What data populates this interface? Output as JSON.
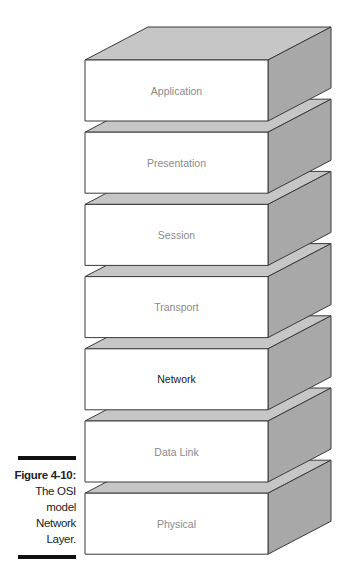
{
  "figure": {
    "label": "Figure 4-10:",
    "caption_lines": [
      "The OSI",
      "model",
      "Network",
      "Layer."
    ]
  },
  "layers": [
    {
      "name": "Application",
      "highlighted": false
    },
    {
      "name": "Presentation",
      "highlighted": false
    },
    {
      "name": "Session",
      "highlighted": false
    },
    {
      "name": "Transport",
      "highlighted": false
    },
    {
      "name": "Network",
      "highlighted": true
    },
    {
      "name": "Data Link",
      "highlighted": false
    },
    {
      "name": "Physical",
      "highlighted": false
    }
  ],
  "colors": {
    "front_face": "#ffffff",
    "top_face": "#c6c6c6",
    "side_face": "#a8a8a8",
    "edge": "#3a3a3a",
    "label": "#8a8a8a",
    "label_highlighted": "#1a1a1a"
  }
}
